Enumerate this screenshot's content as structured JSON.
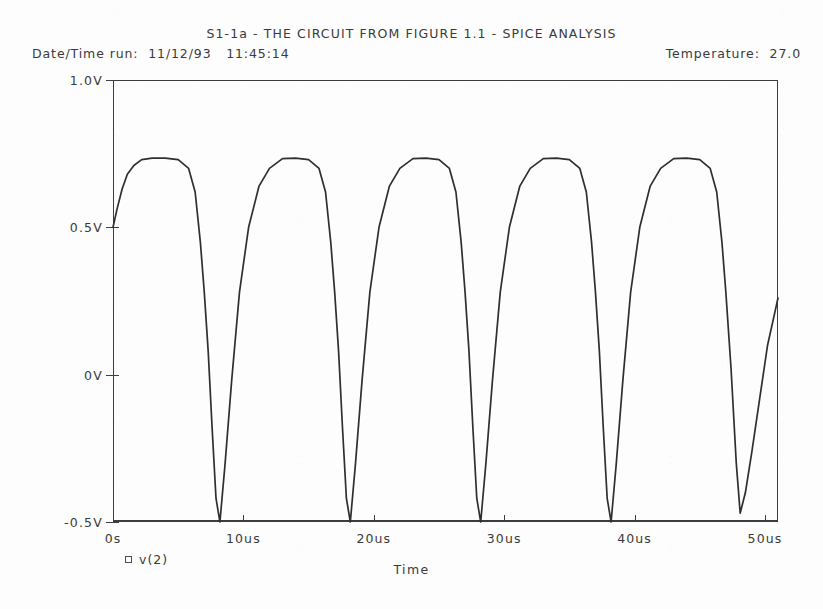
{
  "header": {
    "title": "S1-1a - THE CIRCUIT FROM FIGURE 1.1 - SPICE ANALYSIS",
    "datetime_label": "Date/Time run:  11/12/93   11:45:14",
    "temperature_label": "Temperature:  27.0"
  },
  "legend": {
    "marker": "square-marker-icon",
    "label": "v(2)"
  },
  "chart_data": {
    "type": "line",
    "title": "S1-1a - THE CIRCUIT FROM FIGURE 1.1 - SPICE ANALYSIS",
    "xlabel": "Time",
    "ylabel": "",
    "xlim": [
      0,
      51
    ],
    "ylim": [
      -0.5,
      1.0
    ],
    "x_unit": "us",
    "y_unit": "V",
    "grid": false,
    "legend_position": "below-axis-left",
    "xticks": [
      0,
      10,
      20,
      30,
      40,
      50
    ],
    "xtick_labels": [
      "0s",
      "10us",
      "20us",
      "30us",
      "40us",
      "50us"
    ],
    "yticks": [
      -0.5,
      0,
      0.5,
      1.0
    ],
    "ytick_labels": [
      "-0.5V",
      "0V",
      "0.5V",
      "1.0V"
    ],
    "series": [
      {
        "name": "v(2)",
        "color": "#2f2f2f",
        "x": [
          0.0,
          0.3,
          0.7,
          1.1,
          1.6,
          2.2,
          3.0,
          4.0,
          5.0,
          5.8,
          6.3,
          6.7,
          7.0,
          7.3,
          7.6,
          7.9,
          8.2,
          8.6,
          9.1,
          9.7,
          10.4,
          11.2,
          12.0,
          13.0,
          14.0,
          15.0,
          15.8,
          16.3,
          16.7,
          17.0,
          17.3,
          17.6,
          17.9,
          18.2,
          18.6,
          19.1,
          19.7,
          20.4,
          21.2,
          22.0,
          23.0,
          24.0,
          25.0,
          25.8,
          26.3,
          26.7,
          27.0,
          27.3,
          27.6,
          27.9,
          28.2,
          28.6,
          29.1,
          29.7,
          30.4,
          31.2,
          32.0,
          33.0,
          34.0,
          35.0,
          35.8,
          36.3,
          36.7,
          37.0,
          37.3,
          37.6,
          37.9,
          38.2,
          38.6,
          39.1,
          39.7,
          40.4,
          41.2,
          42.0,
          43.0,
          44.0,
          45.0,
          45.8,
          46.3,
          46.7,
          47.0,
          47.4,
          47.8,
          48.1,
          48.5,
          49.0,
          49.6,
          50.2,
          50.8,
          51.0
        ],
        "y": [
          0.5,
          0.56,
          0.63,
          0.68,
          0.71,
          0.73,
          0.735,
          0.735,
          0.73,
          0.7,
          0.62,
          0.45,
          0.28,
          0.08,
          -0.18,
          -0.42,
          -0.5,
          -0.3,
          -0.02,
          0.28,
          0.5,
          0.64,
          0.7,
          0.733,
          0.735,
          0.73,
          0.7,
          0.62,
          0.45,
          0.28,
          0.08,
          -0.18,
          -0.42,
          -0.5,
          -0.3,
          -0.02,
          0.28,
          0.5,
          0.64,
          0.7,
          0.733,
          0.735,
          0.73,
          0.7,
          0.62,
          0.45,
          0.28,
          0.08,
          -0.18,
          -0.42,
          -0.5,
          -0.3,
          -0.02,
          0.28,
          0.5,
          0.64,
          0.7,
          0.733,
          0.735,
          0.73,
          0.7,
          0.62,
          0.45,
          0.28,
          0.08,
          -0.18,
          -0.42,
          -0.5,
          -0.3,
          -0.02,
          0.28,
          0.5,
          0.64,
          0.7,
          0.733,
          0.735,
          0.73,
          0.7,
          0.62,
          0.45,
          0.28,
          0.02,
          -0.3,
          -0.47,
          -0.4,
          -0.26,
          -0.08,
          0.1,
          0.22,
          0.26
        ]
      }
    ],
    "annotations": {
      "datetime": "Date/Time run:  11/12/93   11:45:14",
      "temperature": "Temperature:  27.0"
    }
  }
}
